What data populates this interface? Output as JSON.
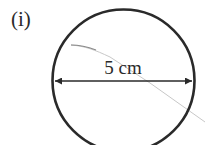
{
  "figure": {
    "label": "(i)",
    "shape": "circle",
    "dimension": {
      "type": "diameter",
      "text": "5 cm",
      "arrow": "double-headed"
    }
  },
  "colors": {
    "stroke": "#2a2a2a",
    "faint_line": "#c8c8c8",
    "background": "#ffffff"
  }
}
